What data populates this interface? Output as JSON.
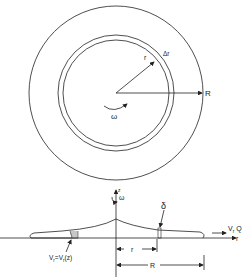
{
  "figure": {
    "top_view": {
      "outer_radius_label": "R",
      "radius_label": "r",
      "ring_width_label": "Δr",
      "rotation_label": "ω"
    },
    "side_view": {
      "z_axis_label": "z",
      "rotation_label": "ω",
      "thickness_label": "δ",
      "outflow_label": "V",
      "outflow_sub": "r",
      "outflow_q": "Q",
      "r_axis_label": "r",
      "profile_label_v": "V",
      "profile_label_sub": "r",
      "profile_label_eq": "=V",
      "profile_label_sub2": "r",
      "profile_label_arg": "(z)",
      "dim_r_label": "r",
      "dim_R_label": "R"
    }
  },
  "colors": {
    "line": "#222222",
    "background": "#ffffff"
  }
}
